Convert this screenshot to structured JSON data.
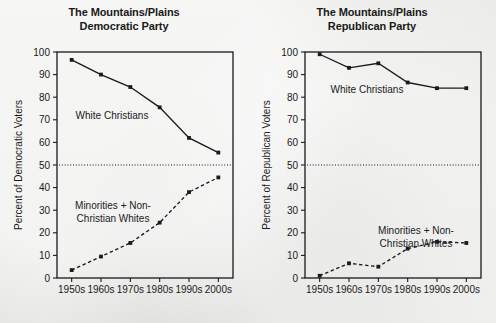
{
  "figure": {
    "background_color": "#e9e9e7",
    "ink_color": "#1a1a1a"
  },
  "panels": [
    {
      "id": "democratic",
      "title_line1": "The Mountains/Plains",
      "title_line2": "Democratic Party",
      "ylabel": "Percent of Democratic Voters",
      "label_white_christians": "White Christians",
      "label_minorities_l1": "Minorities + Non-",
      "label_minorities_l2": "Christian Whites"
    },
    {
      "id": "republican",
      "title_line1": "The Mountains/Plains",
      "title_line2": "Republican Party",
      "ylabel": "Percent of Republican Voters",
      "label_white_christians": "White Christians",
      "label_minorities_l1": "Minorities + Non-",
      "label_minorities_l2": "Christian Whites"
    }
  ],
  "chart_data": [
    {
      "type": "line",
      "title": "The Mountains/Plains Democratic Party",
      "xlabel": "",
      "ylabel": "Percent of Democratic Voters",
      "categories": [
        "1950s",
        "1960s",
        "1970s",
        "1980s",
        "1990s",
        "2000s"
      ],
      "ylim": [
        0,
        100
      ],
      "yticks": [
        0,
        10,
        20,
        30,
        40,
        50,
        60,
        70,
        80,
        90,
        100
      ],
      "grid": false,
      "legend": "inline-annotations",
      "reference_line": {
        "value": 50,
        "style": "dotted"
      },
      "series": [
        {
          "name": "White Christians",
          "style": "solid",
          "marker": "filled-square",
          "values": [
            96.5,
            90.0,
            84.5,
            75.5,
            62.0,
            55.5
          ]
        },
        {
          "name": "Minorities + Non-Christian Whites",
          "style": "dashed",
          "marker": "filled-square",
          "values": [
            3.5,
            9.5,
            15.5,
            24.5,
            38.0,
            44.5
          ]
        }
      ]
    },
    {
      "type": "line",
      "title": "The Mountains/Plains Republican Party",
      "xlabel": "",
      "ylabel": "Percent of Republican Voters",
      "categories": [
        "1950s",
        "1960s",
        "1970s",
        "1980s",
        "1990s",
        "2000s"
      ],
      "ylim": [
        0,
        100
      ],
      "yticks": [
        0,
        10,
        20,
        30,
        40,
        50,
        60,
        70,
        80,
        90,
        100
      ],
      "grid": false,
      "legend": "inline-annotations",
      "reference_line": {
        "value": 50,
        "style": "dotted"
      },
      "series": [
        {
          "name": "White Christians",
          "style": "solid",
          "marker": "filled-square",
          "values": [
            99.0,
            93.0,
            95.0,
            86.5,
            84.0,
            84.0
          ]
        },
        {
          "name": "Minorities + Non-Christian Whites",
          "style": "dashed",
          "marker": "filled-square",
          "values": [
            1.0,
            6.5,
            5.0,
            13.0,
            16.0,
            15.5
          ]
        }
      ]
    }
  ]
}
